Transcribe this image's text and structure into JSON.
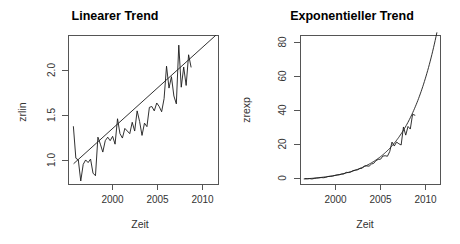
{
  "figure": {
    "background_color": "#ffffff",
    "line_color": "#1a1a1a",
    "axis_color": "#555555",
    "panels": 2
  },
  "chart_data": [
    {
      "type": "line",
      "panel": "left",
      "title": "Linearer Trend",
      "xlabel": "Zeit",
      "ylabel": "zrlin",
      "grid": false,
      "legend": null,
      "xlim": [
        1996.0,
        2011.3
      ],
      "ylim": [
        0.72,
        2.42
      ],
      "xticks": [
        2000,
        2005,
        2010
      ],
      "xtick_labels": [
        "2000",
        "2005",
        "2010"
      ],
      "yticks": [
        1.0,
        1.5,
        2.0
      ],
      "ytick_labels": [
        "1.0",
        "1.5",
        "2.0"
      ],
      "series": [
        {
          "name": "zrlin",
          "kind": "observed",
          "x": [
            1996.5,
            1996.75,
            1997.0,
            1997.25,
            1997.5,
            1997.75,
            1998.0,
            1998.25,
            1998.5,
            1998.75,
            1999.0,
            1999.25,
            1999.5,
            1999.75,
            2000.0,
            2000.25,
            2000.5,
            2000.75,
            2001.0,
            2001.25,
            2001.5,
            2001.75,
            2002.0,
            2002.25,
            2002.5,
            2002.75,
            2003.0,
            2003.25,
            2003.5,
            2003.75,
            2004.0,
            2004.25,
            2004.5,
            2004.75,
            2005.0,
            2005.25,
            2005.5,
            2005.75,
            2006.0,
            2006.25,
            2006.5,
            2006.75,
            2007.0,
            2007.25,
            2007.5,
            2007.75,
            2008.0,
            2008.25,
            2008.5
          ],
          "y": [
            1.38,
            1.02,
            1.0,
            0.76,
            0.95,
            1.0,
            0.97,
            1.01,
            0.85,
            0.82,
            1.26,
            1.18,
            1.09,
            1.22,
            1.26,
            1.22,
            1.27,
            1.18,
            1.47,
            1.3,
            1.25,
            1.36,
            1.33,
            1.3,
            1.43,
            1.33,
            1.56,
            1.44,
            1.28,
            1.42,
            1.38,
            1.6,
            1.61,
            1.56,
            1.65,
            1.61,
            1.55,
            1.7,
            2.07,
            1.82,
            1.95,
            1.73,
            1.64,
            2.31,
            1.83,
            2.06,
            1.85,
            2.2,
            2.06
          ]
        },
        {
          "name": "Trendgerade",
          "kind": "fitted-linear",
          "x": [
            1996.55,
            2011.0
          ],
          "y": [
            0.96,
            2.42
          ]
        }
      ]
    },
    {
      "type": "line",
      "panel": "right",
      "title": "Exponentieller Trend",
      "xlabel": "Zeit",
      "ylabel": "zrexp",
      "grid": false,
      "legend": null,
      "xlim": [
        1996.0,
        2011.3
      ],
      "ylim": [
        -2.0,
        84.0
      ],
      "xticks": [
        2000,
        2005,
        2010
      ],
      "xtick_labels": [
        "2000",
        "2005",
        "2010"
      ],
      "yticks": [
        0,
        20,
        40,
        60,
        80
      ],
      "ytick_labels": [
        "0",
        "20",
        "40",
        "60",
        "80"
      ],
      "series": [
        {
          "name": "zrexp",
          "kind": "observed",
          "x": [
            1996.5,
            1996.75,
            1997.0,
            1997.25,
            1997.5,
            1997.75,
            1998.0,
            1998.25,
            1998.5,
            1998.75,
            1999.0,
            1999.25,
            1999.5,
            1999.75,
            2000.0,
            2000.25,
            2000.5,
            2000.75,
            2001.0,
            2001.25,
            2001.5,
            2001.75,
            2002.0,
            2002.25,
            2002.5,
            2002.75,
            2003.0,
            2003.25,
            2003.5,
            2003.75,
            2004.0,
            2004.25,
            2004.5,
            2004.75,
            2005.0,
            2005.25,
            2005.5,
            2005.75,
            2006.0,
            2006.25,
            2006.5,
            2006.75,
            2007.0,
            2007.25,
            2007.5,
            2007.75,
            2008.0,
            2008.25,
            2008.5
          ],
          "y": [
            1.4,
            1.3,
            1.4,
            1.2,
            1.5,
            1.7,
            1.8,
            2.0,
            1.9,
            2.1,
            2.6,
            2.7,
            2.8,
            3.2,
            3.5,
            3.6,
            4.0,
            4.1,
            5.0,
            4.9,
            5.2,
            6.0,
            6.3,
            6.5,
            7.3,
            7.4,
            8.8,
            8.7,
            8.6,
            9.8,
            10.2,
            11.8,
            12.5,
            12.6,
            14.4,
            14.6,
            14.3,
            17.0,
            22.5,
            20.2,
            22.5,
            21.5,
            20.8,
            31.2,
            26.5,
            31.5,
            30.0,
            38.5,
            38.0
          ]
        },
        {
          "name": "Trendkurve",
          "kind": "fitted-exponential",
          "base_year": 1996.5,
          "a": 1.25,
          "b": 0.2935,
          "x_start": 1996.4,
          "x_end": 2010.9
        }
      ]
    }
  ]
}
